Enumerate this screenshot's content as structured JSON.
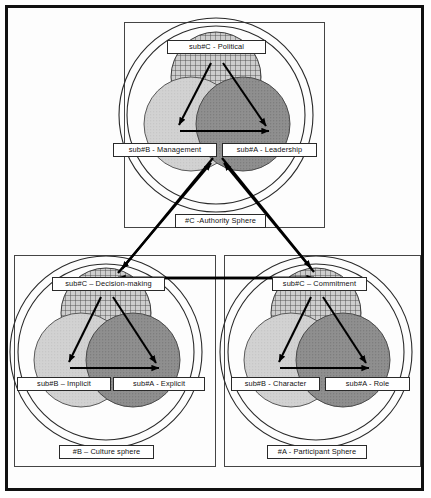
{
  "diagram": {
    "type": "venn-sphere-diagram",
    "colors": {
      "outline": "#2a2a2a",
      "frame": "#111111",
      "circle_b_fill": "#cfcfcf",
      "circle_a_fill": "#8d8d8d",
      "circle_c_fill": "#b8b8b8",
      "label_bg": "#ffffff",
      "arrow": "#000000"
    },
    "panels": [
      {
        "id": "authority",
        "sphere_label": "#C -Authority Sphere",
        "sub_c": "sub#C - Political",
        "sub_b": "sub#B - Management",
        "sub_a": "sub#A - Leadership"
      },
      {
        "id": "culture",
        "sphere_label": "#B – Culture sphere",
        "sub_c": "sub#C – Decision-making",
        "sub_b": "sub#B – Implicit",
        "sub_a": "sub#A - Explicit"
      },
      {
        "id": "participant",
        "sphere_label": "#A - Participant Sphere",
        "sub_c": "sub#C – Commitment",
        "sub_b": "sub#B - Character",
        "sub_a": "sub#A - Role"
      }
    ],
    "connections": [
      {
        "from": "authority",
        "to": "culture",
        "style": "arrow-both"
      },
      {
        "from": "authority",
        "to": "participant",
        "style": "arrow-both"
      },
      {
        "from": "culture",
        "to": "participant",
        "style": "arrow-both"
      }
    ]
  }
}
